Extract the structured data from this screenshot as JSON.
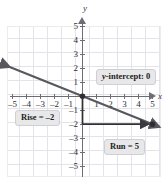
{
  "figure": {
    "title": "",
    "axis_labels": {
      "x": "x",
      "y": "y"
    },
    "callouts": {
      "y_intercept": {
        "prefix": "y",
        "text": "-intercept: 0",
        "full": "y-intercept: 0"
      },
      "rise": "Rise = –2",
      "run": "Run = 5"
    },
    "colors": {
      "grid": "#e3e3ea",
      "axis": "#6d6d74",
      "line": "#58585f",
      "callout_bg": "#e8e8ea",
      "callout_border": "#cfcfd4",
      "text": "#1d1d21"
    }
  },
  "chart_data": {
    "type": "line",
    "title": "",
    "xlabel": "x",
    "ylabel": "y",
    "xlim": [
      -5.5,
      5.5
    ],
    "ylim": [
      -5.5,
      5.5
    ],
    "grid": true,
    "legend": "none",
    "x_ticks": [
      -5,
      -4,
      -3,
      -2,
      -1,
      1,
      2,
      3,
      4,
      5
    ],
    "y_ticks": [
      -5,
      -4,
      -3,
      -2,
      -1,
      1,
      2,
      3,
      4,
      5
    ],
    "x_tick_labels": [
      "–5",
      "–4",
      "–3",
      "–2",
      "–1",
      "1",
      "2",
      "3",
      "4",
      "5"
    ],
    "y_tick_labels": [
      "–5",
      "–4",
      "–3",
      "–2",
      "–1",
      "1",
      "2",
      "3",
      "4",
      "5"
    ],
    "series": [
      {
        "name": "y = -2/5 x",
        "equation": "y = -0.4x",
        "slope": -0.4,
        "rise": -2,
        "run": 5,
        "y_intercept": 0,
        "x": [
          -5.2,
          5.5
        ],
        "y": [
          2.08,
          -2.2
        ],
        "arrow_start": true,
        "arrow_end": true
      }
    ],
    "points": [
      {
        "label": "y-intercept",
        "x": 0,
        "y": 0
      },
      {
        "label": "slope point",
        "x": 5,
        "y": -2
      }
    ],
    "annotations": [
      {
        "text": "y-intercept: 0",
        "x": 1.2,
        "y": 1.6
      },
      {
        "text": "Rise = –2",
        "x": -4.3,
        "y": -1.3
      },
      {
        "text": "Run = 5",
        "x": 1.8,
        "y": -3.4
      }
    ],
    "slope_triangle": {
      "vertical_segment": {
        "from": [
          0,
          0
        ],
        "to": [
          0,
          -2
        ],
        "label": "Rise = –2"
      },
      "horizontal_segment": {
        "from": [
          0,
          -2
        ],
        "to": [
          5,
          -2
        ],
        "label": "Run = 5"
      }
    }
  }
}
